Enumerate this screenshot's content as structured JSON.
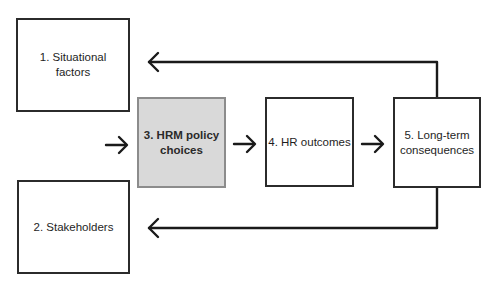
{
  "diagram": {
    "type": "flow-diagram",
    "colors": {
      "stroke": "#2b2b2b",
      "highlight_fill": "#d9d9d9",
      "highlight_border": "#8c8c8c",
      "background": "#ffffff"
    },
    "boxes": [
      {
        "id": "1",
        "label": "1. Situational\nfactors",
        "highlighted": false
      },
      {
        "id": "2",
        "label": "2. Stakeholders",
        "highlighted": false
      },
      {
        "id": "3",
        "label": "3. HRM policy\nchoices",
        "highlighted": true
      },
      {
        "id": "4",
        "label": "4. HR outcomes",
        "highlighted": false
      },
      {
        "id": "5",
        "label": "5. Long-term\nconsequences",
        "highlighted": false
      }
    ],
    "arrows": [
      {
        "from": "inputs",
        "to": "3",
        "direction": "right"
      },
      {
        "from": "3",
        "to": "4",
        "direction": "right"
      },
      {
        "from": "4",
        "to": "5",
        "direction": "right"
      },
      {
        "from": "5",
        "to": "1",
        "direction": "feedback-left-top"
      },
      {
        "from": "5",
        "to": "2",
        "direction": "feedback-left-bottom"
      }
    ]
  }
}
